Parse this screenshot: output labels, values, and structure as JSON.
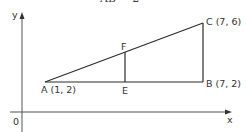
{
  "figure": {
    "clipped_heading_fragment": "AB = 2",
    "axes": {
      "x_label": "x",
      "y_label": "y",
      "origin_label": "0"
    },
    "points": [
      {
        "id": "A",
        "label": "A (1, 2)",
        "x": 1,
        "y": 2
      },
      {
        "id": "B",
        "label": "B (7, 2)",
        "x": 7,
        "y": 2
      },
      {
        "id": "C",
        "label": "C (7, 6)",
        "x": 7,
        "y": 6
      },
      {
        "id": "E",
        "label": "E"
      },
      {
        "id": "F",
        "label": "F"
      }
    ],
    "segments": [
      "AB",
      "BC",
      "AC",
      "EF"
    ],
    "colors": {
      "line": "#2b2b2b",
      "axis": "#555555",
      "text": "#333333"
    }
  }
}
